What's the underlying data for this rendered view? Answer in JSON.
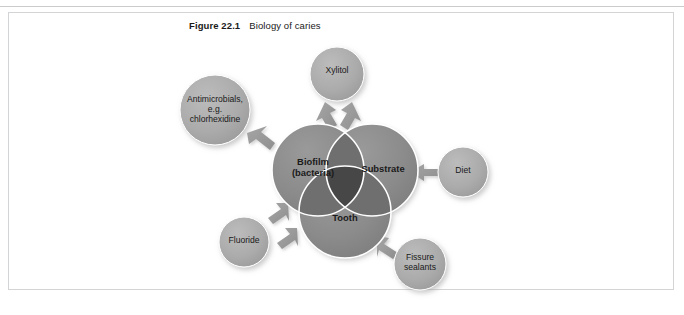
{
  "figure": {
    "number": "Figure 22.1",
    "title": "Biology of caries"
  },
  "colors": {
    "core_circle": "#8c8c8c",
    "core_overlap": "#6f6f6f",
    "core_center": "#4a4a4a",
    "satellite_circle": "#a8a8a8",
    "circle_outline": "#ffffff",
    "arrow": "#9a9a9a",
    "frame_border": "#d2d4d6",
    "text": "#1a1a1a",
    "page_background": "#ffffff"
  },
  "diagram": {
    "type": "venn-with-satellites",
    "core_circles": [
      {
        "id": "biofilm",
        "label": "Biofilm\n(bacteria)",
        "cx": 318,
        "cy": 170,
        "r": 46
      },
      {
        "id": "substrate",
        "label": "Substrate",
        "cx": 372,
        "cy": 170,
        "r": 46
      },
      {
        "id": "tooth",
        "label": "Tooth",
        "cx": 345,
        "cy": 212,
        "r": 46
      }
    ],
    "satellites": [
      {
        "id": "xylitol",
        "label": "Xylitol",
        "cx": 337,
        "cy": 74,
        "r": 27,
        "arrows": 2
      },
      {
        "id": "antimicrobials",
        "label": "Antimicrobials,\ne.g.\nchlorhexidine",
        "cx": 215,
        "cy": 110,
        "r": 35,
        "arrows": 1
      },
      {
        "id": "diet",
        "label": "Diet",
        "cx": 463,
        "cy": 172,
        "r": 25,
        "arrows": 1
      },
      {
        "id": "fluoride",
        "label": "Fluoride",
        "cx": 244,
        "cy": 242,
        "r": 25,
        "arrows": 2
      },
      {
        "id": "fissure",
        "label": "Fissure\nsealants",
        "cx": 420,
        "cy": 264,
        "r": 26,
        "arrows": 1
      }
    ],
    "arrow_targets": {
      "xylitol": [
        "biofilm",
        "substrate"
      ],
      "antimicrobials": [
        "biofilm"
      ],
      "diet": [
        "substrate"
      ],
      "fluoride": [
        "biofilm",
        "tooth"
      ],
      "fissure": [
        "tooth"
      ]
    }
  }
}
